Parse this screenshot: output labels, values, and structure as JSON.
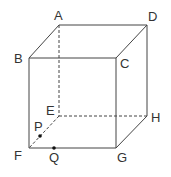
{
  "diagram": {
    "type": "cube",
    "vertices": {
      "A": {
        "label": "A",
        "x": 59,
        "y": 25
      },
      "B": {
        "label": "B",
        "x": 29,
        "y": 58
      },
      "C": {
        "label": "C",
        "x": 116,
        "y": 58
      },
      "D": {
        "label": "D",
        "x": 147,
        "y": 25
      },
      "E": {
        "label": "E",
        "x": 59,
        "y": 116
      },
      "F": {
        "label": "F",
        "x": 29,
        "y": 148
      },
      "G": {
        "label": "G",
        "x": 116,
        "y": 148
      },
      "H": {
        "label": "H",
        "x": 147,
        "y": 116
      }
    },
    "points": {
      "P": {
        "label": "P",
        "on_edge": "EF"
      },
      "Q": {
        "label": "Q",
        "on_edge": "FG"
      }
    },
    "solid_edges": [
      "AB",
      "AD",
      "BC",
      "CD",
      "BF",
      "CG",
      "DH",
      "FG",
      "GH"
    ],
    "hidden_edges": [
      "AE",
      "EH",
      "EF"
    ],
    "colors": {
      "line": "#444444",
      "text": "#333333",
      "background": "#ffffff"
    }
  }
}
